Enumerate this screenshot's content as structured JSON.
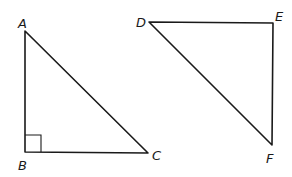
{
  "figure": {
    "triangles": [
      {
        "name": "ABC",
        "vertices": [
          {
            "label": "A",
            "x": 25,
            "y": 31,
            "label_x": 18,
            "label_y": 28
          },
          {
            "label": "B",
            "x": 25,
            "y": 152,
            "label_x": 18,
            "label_y": 170
          },
          {
            "label": "C",
            "x": 148,
            "y": 153,
            "label_x": 152,
            "label_y": 160
          }
        ],
        "right_angle_at": "B"
      },
      {
        "name": "DEF",
        "vertices": [
          {
            "label": "D",
            "x": 149,
            "y": 22,
            "label_x": 136,
            "label_y": 27
          },
          {
            "label": "E",
            "x": 273,
            "y": 23,
            "label_x": 275,
            "label_y": 21
          },
          {
            "label": "F",
            "x": 272,
            "y": 145,
            "label_x": 266,
            "label_y": 162
          }
        ],
        "right_angle_at": null
      }
    ]
  },
  "labels": {
    "A": "A",
    "B": "B",
    "C": "C",
    "D": "D",
    "E": "E",
    "F": "F"
  }
}
